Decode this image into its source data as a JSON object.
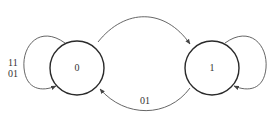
{
  "diagram": {
    "type": "state-transition",
    "states": [
      {
        "id": "s0",
        "label": "0"
      },
      {
        "id": "s1",
        "label": "1"
      }
    ],
    "transitions": [
      {
        "from": "0",
        "to": "0",
        "labels": [
          "11",
          "01"
        ]
      },
      {
        "from": "0",
        "to": "1",
        "label": ""
      },
      {
        "from": "1",
        "to": "1",
        "label": ""
      },
      {
        "from": "1",
        "to": "0",
        "label": "01"
      }
    ],
    "self_loop_0_label_line1": "11",
    "self_loop_0_label_line2": "01",
    "edge_1_to_0_label": "01",
    "colors": {
      "state_stroke": "#2a2a2a",
      "edge_stroke": "#555555",
      "text": "#333333"
    }
  }
}
